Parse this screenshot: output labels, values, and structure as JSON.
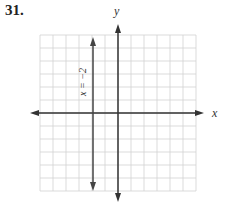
{
  "problem": {
    "number": "31."
  },
  "graph": {
    "x_axis_label": "x",
    "y_axis_label": "y",
    "line_label": "x = −2",
    "grid": {
      "columns": 12,
      "rows": 12,
      "x_min": -6,
      "x_max": 6,
      "y_min": -6,
      "y_max": 6
    },
    "colors": {
      "grid": "#cfcfcf",
      "axis": "#333333",
      "line": "#444444"
    }
  },
  "chart_data": {
    "type": "line",
    "title": "",
    "xlabel": "x",
    "ylabel": "y",
    "xlim": [
      -6,
      6
    ],
    "ylim": [
      -6,
      6
    ],
    "grid": true,
    "series": [
      {
        "name": "x = −2",
        "points": [
          [
            -2,
            -6
          ],
          [
            -2,
            6
          ]
        ],
        "vertical_line": -2
      }
    ],
    "annotations": [
      "x = −2"
    ]
  }
}
